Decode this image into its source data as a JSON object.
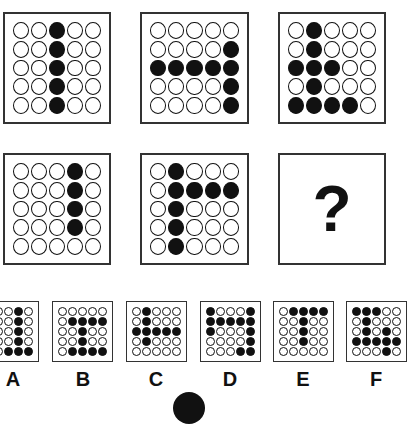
{
  "puzzle": {
    "question_mark": "?",
    "matrix": [
      {
        "id": "p1",
        "cells": [
          [
            0,
            0,
            1,
            0,
            0
          ],
          [
            0,
            0,
            1,
            0,
            0
          ],
          [
            0,
            0,
            1,
            0,
            0
          ],
          [
            0,
            0,
            1,
            0,
            0
          ],
          [
            0,
            0,
            1,
            0,
            0
          ]
        ]
      },
      {
        "id": "p2",
        "cells": [
          [
            0,
            0,
            0,
            0,
            0
          ],
          [
            0,
            0,
            0,
            0,
            1
          ],
          [
            1,
            1,
            1,
            1,
            1
          ],
          [
            0,
            0,
            0,
            0,
            1
          ],
          [
            0,
            0,
            0,
            0,
            1
          ]
        ]
      },
      {
        "id": "p3",
        "cells": [
          [
            0,
            1,
            0,
            0,
            0
          ],
          [
            0,
            1,
            0,
            0,
            0
          ],
          [
            1,
            1,
            1,
            0,
            0
          ],
          [
            0,
            1,
            0,
            0,
            0
          ],
          [
            1,
            1,
            1,
            1,
            0
          ]
        ]
      },
      {
        "id": "p4",
        "cells": [
          [
            0,
            0,
            0,
            1,
            0
          ],
          [
            0,
            0,
            0,
            1,
            0
          ],
          [
            0,
            0,
            0,
            1,
            0
          ],
          [
            0,
            0,
            0,
            1,
            0
          ],
          [
            0,
            0,
            0,
            0,
            0
          ]
        ]
      },
      {
        "id": "p5",
        "cells": [
          [
            0,
            1,
            0,
            0,
            0
          ],
          [
            0,
            1,
            1,
            1,
            1
          ],
          [
            0,
            1,
            0,
            0,
            0
          ],
          [
            0,
            1,
            0,
            0,
            0
          ],
          [
            0,
            1,
            0,
            0,
            0
          ]
        ]
      }
    ],
    "options": [
      {
        "label": "A",
        "cells": [
          [
            0,
            0,
            0,
            1,
            0
          ],
          [
            0,
            0,
            0,
            1,
            0
          ],
          [
            0,
            0,
            0,
            1,
            0
          ],
          [
            0,
            0,
            0,
            1,
            0
          ],
          [
            0,
            0,
            1,
            1,
            1
          ]
        ]
      },
      {
        "label": "B",
        "cells": [
          [
            0,
            0,
            0,
            0,
            0
          ],
          [
            0,
            1,
            1,
            1,
            1
          ],
          [
            0,
            0,
            1,
            0,
            0
          ],
          [
            0,
            0,
            1,
            0,
            0
          ],
          [
            0,
            1,
            1,
            1,
            1
          ]
        ]
      },
      {
        "label": "C",
        "cells": [
          [
            0,
            1,
            0,
            0,
            0
          ],
          [
            0,
            1,
            0,
            0,
            0
          ],
          [
            1,
            1,
            1,
            1,
            1
          ],
          [
            0,
            1,
            0,
            0,
            0
          ],
          [
            0,
            0,
            0,
            0,
            0
          ]
        ]
      },
      {
        "label": "D",
        "cells": [
          [
            1,
            0,
            0,
            0,
            1
          ],
          [
            1,
            1,
            1,
            1,
            1
          ],
          [
            1,
            0,
            0,
            0,
            1
          ],
          [
            0,
            0,
            0,
            0,
            1
          ],
          [
            0,
            0,
            0,
            1,
            1
          ]
        ]
      },
      {
        "label": "E",
        "cells": [
          [
            0,
            1,
            1,
            1,
            1
          ],
          [
            0,
            0,
            1,
            0,
            0
          ],
          [
            0,
            0,
            1,
            0,
            0
          ],
          [
            0,
            0,
            1,
            0,
            0
          ],
          [
            0,
            0,
            0,
            0,
            0
          ]
        ]
      },
      {
        "label": "F",
        "cells": [
          [
            1,
            1,
            1,
            0,
            0
          ],
          [
            0,
            1,
            0,
            0,
            0
          ],
          [
            0,
            1,
            0,
            1,
            0
          ],
          [
            1,
            1,
            1,
            1,
            1
          ],
          [
            0,
            0,
            0,
            1,
            0
          ]
        ]
      }
    ]
  }
}
